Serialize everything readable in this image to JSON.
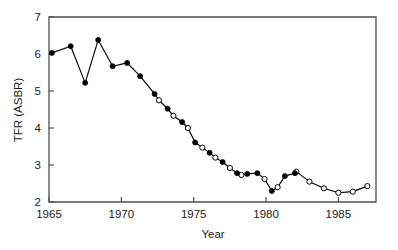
{
  "chart_data": {
    "type": "line",
    "title": "",
    "xlabel": "Year",
    "ylabel": "TFR (ASBR)",
    "xlim": [
      1965,
      1987.6
    ],
    "ylim": [
      2,
      7
    ],
    "xticks": [
      1965,
      1970,
      1975,
      1980,
      1985
    ],
    "xticklabels": [
      "1965",
      "1970",
      "1975",
      "1980",
      "1985"
    ],
    "yticks": [
      2,
      3,
      4,
      5,
      6,
      7
    ],
    "yticklabels": [
      "2",
      "3",
      "4",
      "5",
      "6",
      "7"
    ],
    "grid": false,
    "legend": "none",
    "series": [
      {
        "name": "TFR filled markers",
        "marker": "filled-circle",
        "x": [
          1965.2,
          1966.5,
          1967.5,
          1968.4,
          1969.4,
          1970.4,
          1971.3,
          1972.3,
          1973.2,
          1974.2,
          1975.1,
          1976.1,
          1977.0,
          1978.0,
          1978.7,
          1979.4,
          1980.4,
          1981.3,
          1982.0
        ],
        "y": [
          6.03,
          6.21,
          5.22,
          6.38,
          5.67,
          5.76,
          5.4,
          4.92,
          4.52,
          4.16,
          3.61,
          3.33,
          3.08,
          2.78,
          2.76,
          2.78,
          2.3,
          2.7,
          2.78
        ]
      },
      {
        "name": "ASBR open markers",
        "marker": "open-circle",
        "x": [
          1972.6,
          1973.6,
          1974.6,
          1975.6,
          1976.5,
          1977.5,
          1978.3,
          1979.9,
          1980.8,
          1982.1,
          1983.0,
          1984.0,
          1985.0,
          1986.0,
          1987.0
        ],
        "y": [
          4.75,
          4.33,
          4.0,
          3.47,
          3.2,
          2.92,
          2.73,
          2.62,
          2.4,
          2.82,
          2.55,
          2.37,
          2.25,
          2.28,
          2.43
        ]
      }
    ],
    "combined_path": {
      "x": [
        1965.2,
        1966.5,
        1967.5,
        1968.4,
        1969.4,
        1970.4,
        1971.3,
        1972.3,
        1972.6,
        1973.2,
        1973.6,
        1974.2,
        1974.6,
        1975.1,
        1975.6,
        1976.1,
        1976.5,
        1977.0,
        1977.5,
        1978.0,
        1978.3,
        1978.7,
        1979.4,
        1979.9,
        1980.4,
        1980.8,
        1981.3,
        1982.0,
        1982.1,
        1983.0,
        1984.0,
        1985.0,
        1986.0,
        1987.0
      ],
      "y": [
        6.03,
        6.21,
        5.22,
        6.38,
        5.67,
        5.76,
        5.4,
        4.92,
        4.75,
        4.52,
        4.33,
        4.16,
        4.0,
        3.61,
        3.47,
        3.33,
        3.2,
        3.08,
        2.92,
        2.78,
        2.73,
        2.76,
        2.78,
        2.62,
        2.3,
        2.4,
        2.7,
        2.78,
        2.82,
        2.55,
        2.37,
        2.25,
        2.28,
        2.43
      ]
    }
  },
  "figure": {
    "background_color": "#ffffff",
    "axis_color": "#4f4f4f",
    "data_color": "#000000"
  }
}
